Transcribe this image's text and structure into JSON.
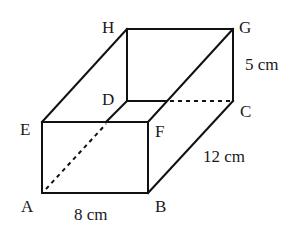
{
  "figure": {
    "type": "cuboid",
    "vertices": {
      "A": {
        "label": "A",
        "x": 42,
        "y": 193
      },
      "B": {
        "label": "B",
        "x": 148,
        "y": 193
      },
      "C": {
        "label": "C",
        "x": 233,
        "y": 101
      },
      "D": {
        "label": "D",
        "x": 127,
        "y": 101
      },
      "E": {
        "label": "E",
        "x": 42,
        "y": 122
      },
      "F": {
        "label": "F",
        "x": 148,
        "y": 122
      },
      "G": {
        "label": "G",
        "x": 233,
        "y": 29
      },
      "H": {
        "label": "H",
        "x": 127,
        "y": 29
      }
    },
    "dimensions": {
      "length": "8 cm",
      "width": "12 cm",
      "height": "5 cm"
    }
  }
}
